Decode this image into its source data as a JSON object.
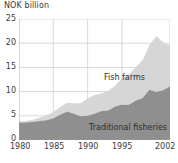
{
  "chart_data": {
    "type": "area",
    "stacked": true,
    "title": "",
    "ylabel": "NOK billion",
    "xlabel": "",
    "ylim": [
      0,
      25
    ],
    "xlim": [
      1980,
      2002
    ],
    "yticks": [
      0,
      5,
      10,
      15,
      20,
      25
    ],
    "ytick_labels": [
      "0",
      "5",
      "10",
      "15",
      "20",
      "25"
    ],
    "xticks": [
      1980,
      1985,
      1990,
      1995,
      2002
    ],
    "xtick_labels": [
      "1980",
      "1985",
      "1990",
      "1995",
      "2002"
    ],
    "grid": true,
    "legend_position": "inline-annotation",
    "x": [
      1980,
      1981,
      1982,
      1983,
      1984,
      1985,
      1986,
      1987,
      1988,
      1989,
      1990,
      1991,
      1992,
      1993,
      1994,
      1995,
      1996,
      1997,
      1998,
      1999,
      2000,
      2001,
      2002
    ],
    "series": [
      {
        "name": "Traditional fisheries",
        "color": "#8f8f8f",
        "values": [
          3.6,
          3.6,
          3.7,
          3.9,
          4.1,
          4.5,
          5.2,
          5.9,
          5.4,
          4.9,
          5.0,
          5.4,
          6.0,
          6.1,
          6.9,
          7.3,
          7.3,
          8.1,
          8.7,
          10.4,
          9.9,
          10.3,
          11.1
        ]
      },
      {
        "name": "Fish farms",
        "color": "#d6d6d6",
        "values": [
          0.2,
          0.3,
          0.5,
          0.7,
          1.0,
          1.3,
          1.6,
          1.8,
          2.2,
          2.7,
          3.6,
          3.9,
          3.6,
          4.0,
          4.3,
          5.4,
          6.3,
          6.9,
          7.8,
          9.2,
          11.6,
          9.9,
          8.4
        ]
      }
    ],
    "totals": [
      3.8,
      3.9,
      4.2,
      4.6,
      5.1,
      5.8,
      6.8,
      7.7,
      7.6,
      7.6,
      8.6,
      9.3,
      9.6,
      10.1,
      11.2,
      12.7,
      13.6,
      15.0,
      16.5,
      19.6,
      21.5,
      20.2,
      19.5
    ]
  },
  "labels": {
    "fish_farms": "Fish farms",
    "traditional_fisheries": "Traditional fisheries"
  },
  "colors": {
    "traditional": "#8f8f8f",
    "fish_farms": "#d6d6d6",
    "grid": "#c8c8c8",
    "text": "#3a3a3a"
  }
}
